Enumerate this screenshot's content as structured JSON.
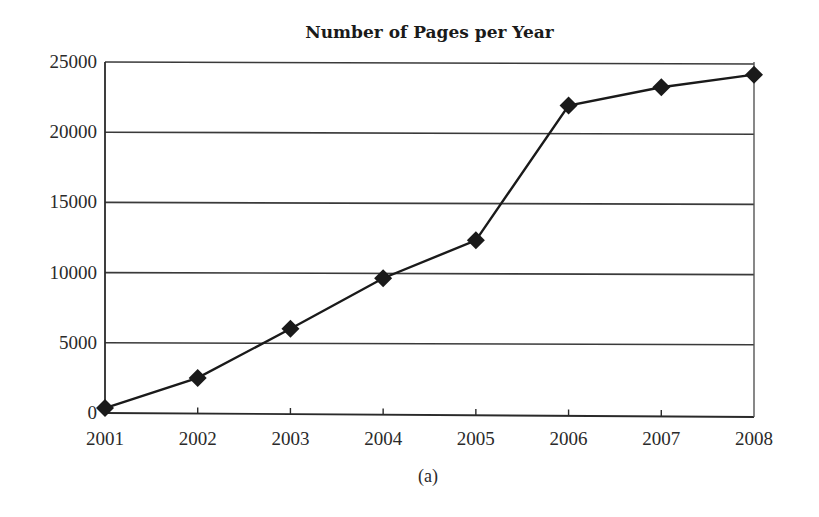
{
  "chart_data": {
    "type": "line",
    "title": "Number of Pages per Year",
    "caption": "(a)",
    "xlabel": "",
    "ylabel": "",
    "categories": [
      "2001",
      "2002",
      "2003",
      "2004",
      "2005",
      "2006",
      "2007",
      "2008"
    ],
    "series": [
      {
        "name": "Number of Pages",
        "marker": "diamond",
        "color": "#1a1a1a",
        "values": [
          350,
          2500,
          6000,
          9600,
          12300,
          21900,
          23200,
          24100
        ]
      }
    ],
    "ylim": [
      0,
      25000
    ],
    "yticks": [
      "0",
      "5000",
      "10000",
      "15000",
      "20000",
      "25000"
    ],
    "grid": "horizontal",
    "legend": "none"
  }
}
